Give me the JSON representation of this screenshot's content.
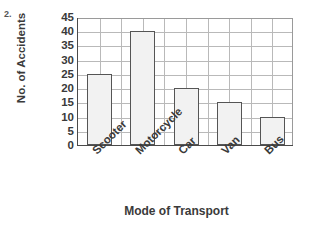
{
  "question_number": "2.",
  "chart_data": {
    "type": "bar",
    "title": "",
    "xlabel": "Mode of Transport",
    "ylabel": "No. of Accidents",
    "categories": [
      "Scooter",
      "Motorcycle",
      "Car",
      "Van",
      "Bus"
    ],
    "values": [
      25,
      40,
      20,
      15,
      10
    ],
    "ylim": [
      0,
      45
    ],
    "ytick_step": 5,
    "yticks": [
      45,
      40,
      35,
      30,
      25,
      20,
      15,
      10,
      5,
      0
    ],
    "grid": true,
    "legend": "none",
    "bar_fill_color": "#f2f2f2",
    "bar_border_color": "#555555",
    "grid_color": "#b9b9b9",
    "axis_color": "#4a4a4a",
    "x_label_rotation": -45
  }
}
